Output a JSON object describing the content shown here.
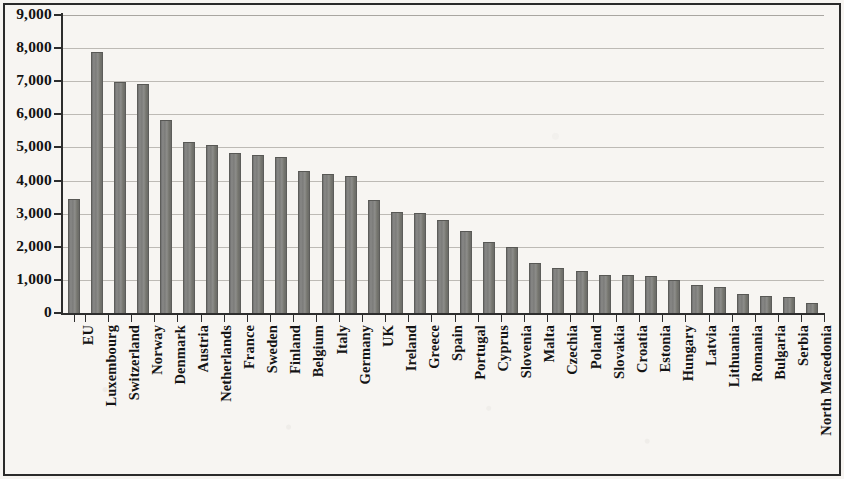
{
  "chart_data": {
    "type": "bar",
    "title": "",
    "subtitle": "",
    "xlabel": "",
    "ylabel": "",
    "ylim": [
      0,
      9000
    ],
    "ytick_labels": [
      "9,000",
      "8,000",
      "7,000",
      "6,000",
      "5,000",
      "4,000",
      "3,000",
      "2,000",
      "1,000",
      "0"
    ],
    "ytick_values": [
      9000,
      8000,
      7000,
      6000,
      5000,
      4000,
      3000,
      2000,
      1000,
      0
    ],
    "grid": true,
    "legend": "none",
    "bar_color": "#7c7c7a",
    "bar_edge_color": "#5d5d5a",
    "background_color": "#f7f5f2",
    "frame_color": "#2a2a2a",
    "axis_color": "#2d2d2d",
    "gridline_color": "#bdbab5",
    "categories": [
      "EU",
      "Luxembourg",
      "Switzerland",
      "Norway",
      "Denmark",
      "Austria",
      "Netherlands",
      "France",
      "Sweden",
      "Finland",
      "Belgium",
      "Italy",
      "Germany",
      "UK",
      "Ireland",
      "Greece",
      "Spain",
      "Portugal",
      "Cyprus",
      "Slovenia",
      "Malta",
      "Czechia",
      "Poland",
      "Slovakia",
      "Croatia",
      "Estonia",
      "Hungary",
      "Latvia",
      "Lithuania",
      "Romania",
      "Bulgaria",
      "Serbia",
      "North Macedonia"
    ],
    "values": [
      3430,
      7880,
      6980,
      6930,
      5840,
      5160,
      5060,
      4820,
      4760,
      4720,
      4290,
      4200,
      4150,
      3410,
      3060,
      3020,
      2820,
      2470,
      2140,
      1990,
      1500,
      1350,
      1280,
      1160,
      1140,
      1120,
      1000,
      850,
      800,
      570,
      510,
      490,
      300
    ]
  }
}
